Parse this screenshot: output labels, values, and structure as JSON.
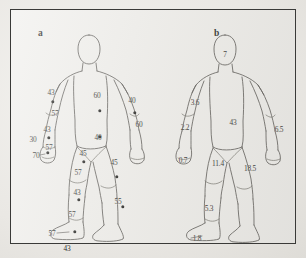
{
  "figure": {
    "background_color": "#eceae6",
    "plate_color": "#f0efec",
    "border_color": "#3a3a38",
    "ink_color": "#54524e",
    "marker_color": "#1a1a18"
  },
  "panels": [
    {
      "id": "a",
      "label": "a",
      "description": "Anterior human body outline with segment values and point markers",
      "values": [
        {
          "name": "left-upper-arm-value",
          "text": "43",
          "x": 40,
          "y": 82,
          "marker": true,
          "marker_x": 42,
          "marker_y": 92
        },
        {
          "name": "left-elbow-value",
          "text": "57",
          "x": 44,
          "y": 103,
          "marker": false
        },
        {
          "name": "left-forearm-value",
          "text": "43",
          "x": 36,
          "y": 119,
          "marker": true,
          "marker_x": 38,
          "marker_y": 128
        },
        {
          "name": "left-wrist-value",
          "text": "57",
          "x": 38,
          "y": 137,
          "marker": false
        },
        {
          "name": "left-hand-outer-value",
          "text": "30",
          "x": 22,
          "y": 129,
          "marker": false
        },
        {
          "name": "left-hand-value",
          "text": "70",
          "x": 25,
          "y": 145,
          "marker": true,
          "marker_x": 37,
          "marker_y": 143
        },
        {
          "name": "chest-value",
          "text": "60",
          "x": 86,
          "y": 85,
          "marker": true,
          "marker_x": 89,
          "marker_y": 101
        },
        {
          "name": "abdomen-value",
          "text": "40",
          "x": 87,
          "y": 127,
          "marker": true,
          "marker_x": 89,
          "marker_y": 127
        },
        {
          "name": "right-upper-arm-value",
          "text": "40",
          "x": 121,
          "y": 90,
          "marker": true,
          "marker_x": 124,
          "marker_y": 103
        },
        {
          "name": "right-forearm-value",
          "text": "60",
          "x": 128,
          "y": 114,
          "marker": false
        },
        {
          "name": "left-thigh-value",
          "text": "45",
          "x": 72,
          "y": 143,
          "marker": true,
          "marker_x": 73,
          "marker_y": 152
        },
        {
          "name": "left-knee-value",
          "text": "57",
          "x": 67,
          "y": 162,
          "marker": false
        },
        {
          "name": "left-calf-value",
          "text": "43",
          "x": 66,
          "y": 182,
          "marker": true,
          "marker_x": 68,
          "marker_y": 190
        },
        {
          "name": "left-ankle-value",
          "text": "57",
          "x": 61,
          "y": 204,
          "marker": false
        },
        {
          "name": "left-foot-outer-value",
          "text": "57",
          "x": 41,
          "y": 223,
          "marker": true,
          "marker_x": 64,
          "marker_y": 222
        },
        {
          "name": "left-foot-value",
          "text": "43",
          "x": 56,
          "y": 238,
          "marker": false
        },
        {
          "name": "right-thigh-value",
          "text": "45",
          "x": 103,
          "y": 152,
          "marker": true,
          "marker_x": 106,
          "marker_y": 167
        },
        {
          "name": "right-calf-value",
          "text": "55",
          "x": 107,
          "y": 191,
          "marker": true,
          "marker_x": 112,
          "marker_y": 197
        }
      ]
    },
    {
      "id": "b",
      "label": "b",
      "description": "Anterior human body outline with decimal segment values",
      "values": [
        {
          "name": "head-value",
          "text": "7",
          "x": 64,
          "y": 44,
          "marker": false
        },
        {
          "name": "left-upper-arm-value",
          "text": "3.6",
          "x": 34,
          "y": 92,
          "marker": false
        },
        {
          "name": "left-forearm-value",
          "text": "2.2",
          "x": 24,
          "y": 117,
          "marker": false
        },
        {
          "name": "trunk-value",
          "text": "43",
          "x": 72,
          "y": 112,
          "marker": false
        },
        {
          "name": "right-arm-value",
          "text": "6.5",
          "x": 118,
          "y": 119,
          "marker": false
        },
        {
          "name": "left-hand-value",
          "text": "0.7",
          "x": 22,
          "y": 150,
          "marker": false
        },
        {
          "name": "left-thigh-value",
          "text": "11.4",
          "x": 57,
          "y": 153,
          "marker": false
        },
        {
          "name": "right-thigh-value",
          "text": "18.5",
          "x": 89,
          "y": 158,
          "marker": false
        },
        {
          "name": "left-calf-value",
          "text": "5.3",
          "x": 48,
          "y": 198,
          "marker": false
        },
        {
          "name": "left-foot-value",
          "text": "1.8",
          "x": 36,
          "y": 228,
          "marker": false
        }
      ]
    }
  ]
}
